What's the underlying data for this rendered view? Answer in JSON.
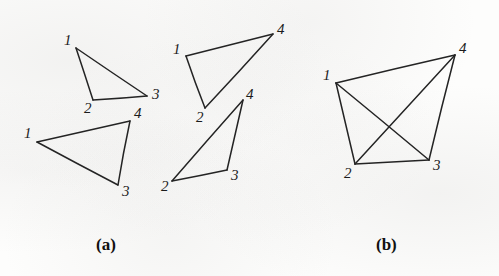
{
  "figure": {
    "background_color": "#fdfdfc",
    "ink_color": "#242424",
    "width": 499,
    "height": 276,
    "panels": [
      {
        "id": "panel-a",
        "caption": "(a)",
        "caption_x": 96,
        "caption_y": 236,
        "description": "Four separate triangles, each a 3-cycle on a subset of vertices 1,2,3,4"
      },
      {
        "id": "panel-b",
        "caption": "(b)",
        "caption_x": 376,
        "caption_y": 236,
        "description": "Complete graph K4 on vertices 1,2,3,4 with crossing diagonals"
      }
    ]
  },
  "graphs": [
    {
      "name": "triangle-a1",
      "panel": "panel-a",
      "vertices": [
        {
          "label": "1",
          "x": 76,
          "y": 48,
          "label_x": 64,
          "label_y": 33
        },
        {
          "label": "2",
          "x": 93,
          "y": 100,
          "label_x": 84,
          "label_y": 101
        },
        {
          "label": "3",
          "x": 147,
          "y": 96,
          "label_x": 152,
          "label_y": 87
        }
      ],
      "edges": [
        [
          0,
          1
        ],
        [
          1,
          2
        ],
        [
          2,
          0
        ]
      ]
    },
    {
      "name": "triangle-a2",
      "panel": "panel-a",
      "vertices": [
        {
          "label": "1",
          "x": 37,
          "y": 142,
          "label_x": 24,
          "label_y": 126
        },
        {
          "label": "4",
          "x": 130,
          "y": 121,
          "label_x": 134,
          "label_y": 106
        },
        {
          "label": "3",
          "x": 118,
          "y": 185,
          "label_x": 122,
          "label_y": 184
        }
      ],
      "edges": [
        [
          0,
          1
        ],
        [
          1,
          2
        ],
        [
          2,
          0
        ]
      ]
    },
    {
      "name": "triangle-a3",
      "panel": "panel-a",
      "vertices": [
        {
          "label": "1",
          "x": 186,
          "y": 56,
          "label_x": 173,
          "label_y": 42
        },
        {
          "label": "4",
          "x": 273,
          "y": 34,
          "label_x": 277,
          "label_y": 22
        },
        {
          "label": "2",
          "x": 205,
          "y": 108,
          "label_x": 196,
          "label_y": 110
        }
      ],
      "edges": [
        [
          0,
          1
        ],
        [
          1,
          2
        ],
        [
          2,
          0
        ]
      ]
    },
    {
      "name": "triangle-a4",
      "panel": "panel-a",
      "vertices": [
        {
          "label": "4",
          "x": 243,
          "y": 100,
          "label_x": 246,
          "label_y": 87
        },
        {
          "label": "3",
          "x": 227,
          "y": 170,
          "label_x": 231,
          "label_y": 168
        },
        {
          "label": "2",
          "x": 172,
          "y": 181,
          "label_x": 161,
          "label_y": 179
        }
      ],
      "edges": [
        [
          0,
          1
        ],
        [
          1,
          2
        ],
        [
          2,
          0
        ]
      ]
    },
    {
      "name": "complete-graph-b",
      "panel": "panel-b",
      "vertices": [
        {
          "label": "1",
          "x": 336,
          "y": 83,
          "label_x": 323,
          "label_y": 68
        },
        {
          "label": "4",
          "x": 455,
          "y": 55,
          "label_x": 459,
          "label_y": 41
        },
        {
          "label": "3",
          "x": 429,
          "y": 160,
          "label_x": 433,
          "label_y": 158
        },
        {
          "label": "2",
          "x": 355,
          "y": 164,
          "label_x": 344,
          "label_y": 166
        }
      ],
      "edges": [
        [
          0,
          1
        ],
        [
          1,
          2
        ],
        [
          2,
          3
        ],
        [
          3,
          0
        ],
        [
          0,
          2
        ],
        [
          3,
          1
        ]
      ]
    }
  ]
}
